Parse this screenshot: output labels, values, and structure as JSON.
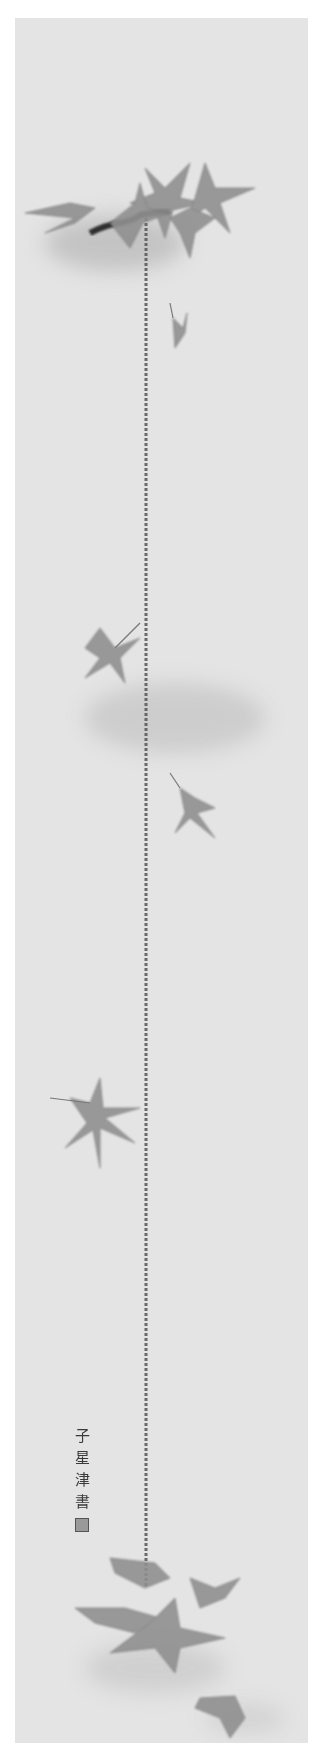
{
  "artwork": {
    "type": "hanging-scroll-painting",
    "subject": "maple leaves with hanging thread",
    "palette": {
      "paper": "#e4e4e4",
      "border": "#ffffff",
      "ink_dark": "#3a3a3a",
      "leaf": "#8c8c8c",
      "wash": "#c8c8c8"
    },
    "inscription": {
      "characters": [
        "子",
        "星",
        "津",
        "書"
      ],
      "seal": "seal-stamp"
    },
    "elements": [
      {
        "name": "top-leaf-cluster",
        "y": 160
      },
      {
        "name": "small-falling-leaf",
        "y": 305
      },
      {
        "name": "leaf-left-mid",
        "y": 635
      },
      {
        "name": "leaf-right-mid",
        "y": 775
      },
      {
        "name": "leaf-left-lower",
        "y": 1095
      },
      {
        "name": "bottom-leaf-cluster",
        "y": 1620
      },
      {
        "name": "bottom-right-leaf",
        "y": 1700
      }
    ]
  }
}
